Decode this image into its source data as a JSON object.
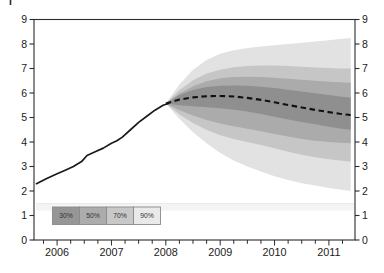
{
  "chart_data": {
    "type": "area",
    "subtype": "fan-chart",
    "title": "",
    "x_axis": {
      "range": [
        2005.575,
        2011.48
      ],
      "year_labels": [
        "2006",
        "2007",
        "2008",
        "2009",
        "2010",
        "2011"
      ],
      "year_values": [
        2006,
        2007,
        2008,
        2009,
        2010,
        2011
      ],
      "minor_tick_interval": 0.25
    },
    "y_axis": {
      "range": [
        0,
        9
      ],
      "tick_labels": [
        "0",
        "1",
        "2",
        "3",
        "4",
        "5",
        "6",
        "7",
        "8",
        "9"
      ],
      "tick_values": [
        0,
        1,
        2,
        3,
        4,
        5,
        6,
        7,
        8,
        9
      ],
      "sides": "both"
    },
    "history": {
      "name": "historical-series",
      "style": "solid",
      "color": "#1a1a1a",
      "points": [
        [
          2005.62,
          2.3
        ],
        [
          2005.8,
          2.5
        ],
        [
          2006.0,
          2.7
        ],
        [
          2006.15,
          2.85
        ],
        [
          2006.3,
          3.0
        ],
        [
          2006.45,
          3.2
        ],
        [
          2006.55,
          3.45
        ],
        [
          2006.7,
          3.6
        ],
        [
          2006.85,
          3.75
        ],
        [
          2007.0,
          3.95
        ],
        [
          2007.1,
          4.05
        ],
        [
          2007.2,
          4.2
        ],
        [
          2007.35,
          4.5
        ],
        [
          2007.5,
          4.8
        ],
        [
          2007.65,
          5.05
        ],
        [
          2007.8,
          5.3
        ],
        [
          2007.95,
          5.5
        ],
        [
          2008.05,
          5.57
        ]
      ]
    },
    "projection": {
      "name": "central-projection",
      "style": "dashed",
      "color": "#111111",
      "x": [
        2008.0,
        2008.25,
        2008.5,
        2008.75,
        2009.0,
        2009.25,
        2009.5,
        2009.75,
        2010.0,
        2010.25,
        2010.5,
        2010.75,
        2011.0,
        2011.2,
        2011.4
      ],
      "values": [
        5.57,
        5.73,
        5.82,
        5.87,
        5.88,
        5.86,
        5.8,
        5.72,
        5.62,
        5.51,
        5.41,
        5.31,
        5.22,
        5.15,
        5.1
      ]
    },
    "bands": [
      {
        "name": "90%",
        "color": "#e2e2e2",
        "upper": [
          5.57,
          6.35,
          6.95,
          7.35,
          7.6,
          7.75,
          7.84,
          7.9,
          7.95,
          8.0,
          8.05,
          8.1,
          8.15,
          8.2,
          8.25
        ],
        "lower": [
          5.57,
          4.95,
          4.4,
          3.95,
          3.55,
          3.25,
          3.0,
          2.8,
          2.6,
          2.45,
          2.32,
          2.22,
          2.12,
          2.06,
          2.0
        ]
      },
      {
        "name": "70%",
        "color": "#c6c6c6",
        "upper": [
          5.57,
          6.12,
          6.52,
          6.8,
          6.95,
          7.05,
          7.1,
          7.12,
          7.12,
          7.1,
          7.07,
          7.04,
          7.02,
          7.0,
          7.0
        ],
        "lower": [
          5.57,
          5.12,
          4.78,
          4.5,
          4.28,
          4.12,
          4.0,
          3.88,
          3.74,
          3.6,
          3.48,
          3.38,
          3.3,
          3.24,
          3.2
        ]
      },
      {
        "name": "50%",
        "color": "#ababab",
        "upper": [
          5.57,
          5.98,
          6.28,
          6.48,
          6.6,
          6.65,
          6.66,
          6.65,
          6.62,
          6.58,
          6.54,
          6.5,
          6.46,
          6.44,
          6.42
        ],
        "lower": [
          5.57,
          5.3,
          5.08,
          4.9,
          4.76,
          4.64,
          4.54,
          4.44,
          4.33,
          4.22,
          4.12,
          4.05,
          4.0,
          3.97,
          3.95
        ]
      },
      {
        "name": "30%",
        "color": "#8f8f8f",
        "upper": [
          5.57,
          5.92,
          6.12,
          6.24,
          6.3,
          6.31,
          6.3,
          6.26,
          6.2,
          6.13,
          6.06,
          5.99,
          5.92,
          5.86,
          5.82
        ],
        "lower": [
          5.57,
          5.5,
          5.46,
          5.42,
          5.38,
          5.32,
          5.24,
          5.14,
          5.03,
          4.92,
          4.82,
          4.72,
          4.62,
          4.55,
          4.5
        ]
      }
    ],
    "legend": {
      "position": "bottom-left",
      "items": [
        {
          "label": "30%",
          "color": "#969696"
        },
        {
          "label": "50%",
          "color": "#acacac"
        },
        {
          "label": "70%",
          "color": "#c8c8c8"
        },
        {
          "label": "90%",
          "color": "#e9e9e9"
        }
      ]
    },
    "colors": {
      "axis": "#2b2b2b",
      "tick_label": "#1a1a1a",
      "legend_border": "#8a8a8a",
      "legend_text": "#333333",
      "scan_strip": "#f4f4f4",
      "scan_strip_edge": "#e4e4e4"
    },
    "grid": "off"
  }
}
